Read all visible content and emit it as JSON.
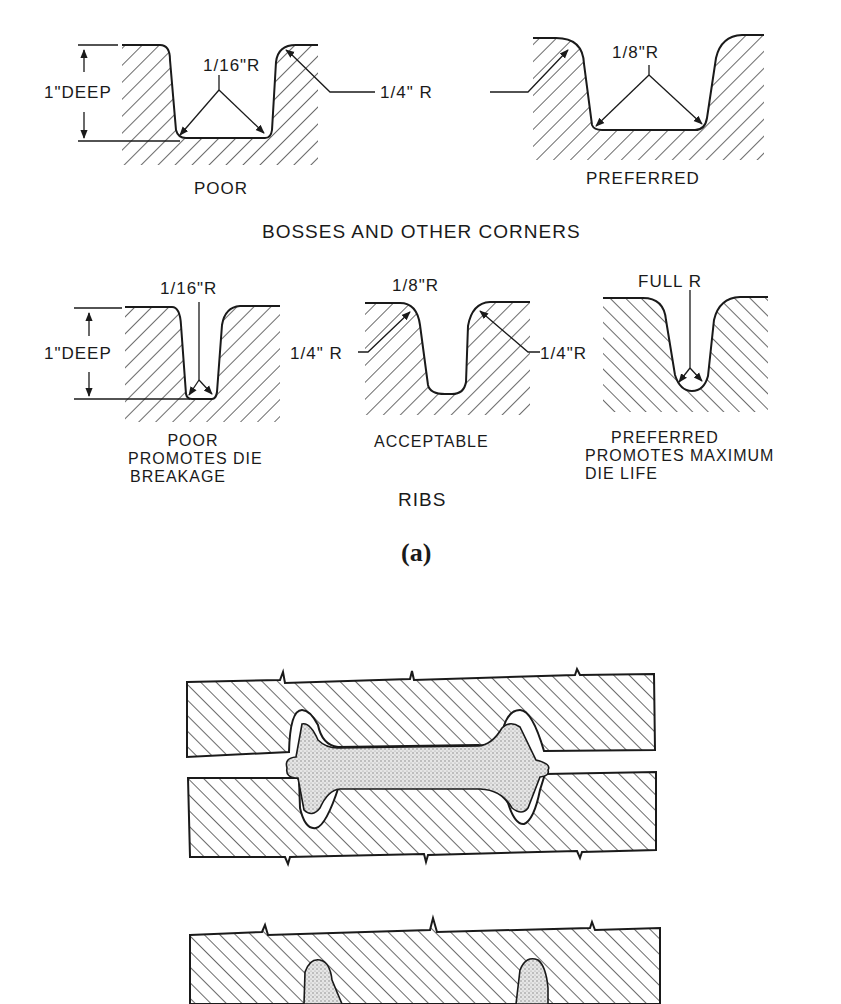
{
  "figure": {
    "label": "(a)",
    "colors": {
      "ink": "#1a1a1a",
      "background": "#ffffff",
      "stipple": "#9a9a9a"
    }
  },
  "bosses": {
    "title": "BOSSES AND OTHER CORNERS",
    "poor": {
      "caption": "POOR",
      "depth_label": "1\"DEEP",
      "radius_label": "1/16\"R"
    },
    "preferred": {
      "caption": "PREFERRED",
      "radius_label": "1/8\"R"
    },
    "shared_corner_label": "1/4\" R"
  },
  "ribs": {
    "title": "RIBS",
    "poor": {
      "caption_lines": [
        "POOR",
        "PROMOTES DIE",
        "BREAKAGE"
      ],
      "depth_label": "1\"DEEP",
      "radius_label": "1/16\"R"
    },
    "acceptable": {
      "caption": "ACCEPTABLE",
      "radius_label": "1/8\"R",
      "left_corner_label": "1/4\" R",
      "right_corner_label": "1/4\"R"
    },
    "preferred": {
      "caption_lines": [
        "PREFERRED",
        "PROMOTES MAXIMUM",
        "DIE LIFE"
      ],
      "radius_label": "FULL R"
    }
  },
  "dies": {
    "panels": [
      {
        "name": "closed-die-assembly",
        "description": "upper and lower die with stippled I-section forging"
      },
      {
        "name": "upper-die-partial",
        "description": "upper die with partially filled cavities"
      }
    ]
  }
}
